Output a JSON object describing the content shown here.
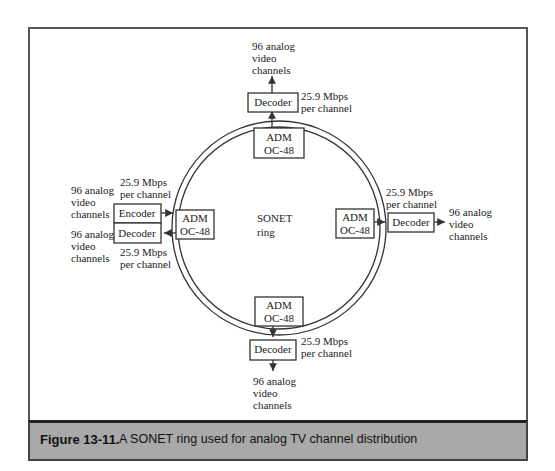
{
  "figure": {
    "number": "Figure 13-11.",
    "caption": "A SONET ring used for analog TV channel distribution"
  },
  "ring": {
    "label_line1": "SONET",
    "label_line2": "ring"
  },
  "nodes": {
    "top": {
      "adm_line1": "ADM",
      "adm_line2": "OC-48",
      "device": "Decoder",
      "rate_line1": "25.9 Mbps",
      "rate_line2": "per channel",
      "ch_line1": "96 analog",
      "ch_line2": "video",
      "ch_line3": "channels"
    },
    "right": {
      "adm_line1": "ADM",
      "adm_line2": "OC-48",
      "device": "Decoder",
      "rate_line1": "25.9 Mbps",
      "rate_line2": "per channel",
      "ch_line1": "96 analog",
      "ch_line2": "video",
      "ch_line3": "channels"
    },
    "bottom": {
      "adm_line1": "ADM",
      "adm_line2": "OC-48",
      "device": "Decoder",
      "rate_line1": "25.9 Mbps",
      "rate_line2": "per channel",
      "ch_line1": "96 analog",
      "ch_line2": "video",
      "ch_line3": "channels"
    },
    "left": {
      "adm_line1": "ADM",
      "adm_line2": "OC-48",
      "encoder": "Encoder",
      "decoder": "Decoder",
      "enc_rate_line1": "25.9 Mbps",
      "enc_rate_line2": "per channel",
      "dec_rate_line1": "25.9 Mbps",
      "dec_rate_line2": "per channel",
      "enc_ch_line1": "96 analog",
      "enc_ch_line2": "video",
      "enc_ch_line3": "channels",
      "dec_ch_line1": "96 analog",
      "dec_ch_line2": "video",
      "dec_ch_line3": "channels"
    }
  }
}
